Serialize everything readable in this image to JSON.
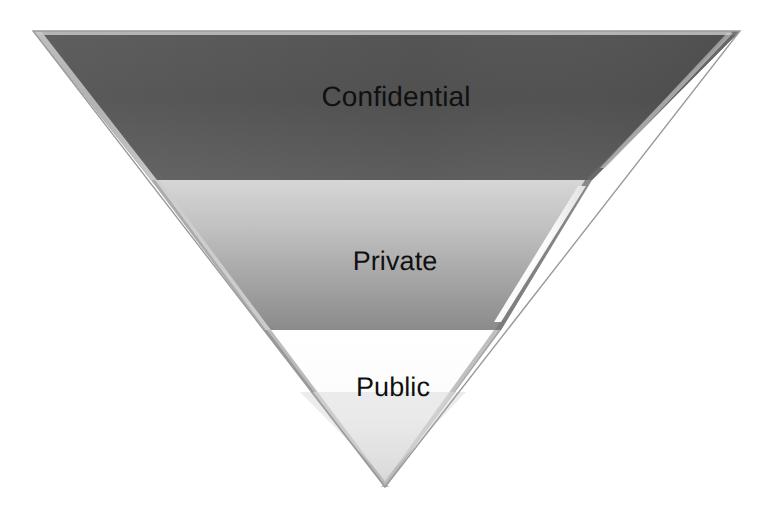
{
  "diagram": {
    "type": "inverted-pyramid",
    "background_color": "#ffffff",
    "outline_color": "#9a9a9a",
    "label_color": "#101010",
    "geometry": {
      "top_left_x": 33,
      "top_right_x": 740,
      "top_y": 31,
      "apex_x": 385,
      "apex_y": 487
    },
    "layers": [
      {
        "label": "Confidential",
        "level": 1,
        "fill_top_color": "#4f4f4f",
        "fill_bottom_color": "#5f5f5f",
        "top_y": 31,
        "bottom_y": 180,
        "label_x": 396,
        "label_y": 97,
        "font_size_px": 28
      },
      {
        "label": "Private",
        "level": 2,
        "fill_top_color": "#d0d0d0",
        "fill_bottom_color": "#8a8a8a",
        "top_y": 180,
        "bottom_y": 330,
        "label_x": 395,
        "label_y": 261,
        "font_size_px": 27
      },
      {
        "label": "Public",
        "level": 3,
        "fill_top_color": "#ffffff",
        "fill_bottom_color": "#d8d8d8",
        "top_y": 330,
        "bottom_y": 487,
        "label_x": 393,
        "label_y": 387,
        "font_size_px": 27
      }
    ],
    "bevels": {
      "left_edge_color": "#b8b8b8",
      "right_edge_highlight_color": "#ffffff",
      "right_edge_shadow_color": "#707070",
      "top_edge_color": "#bdbdbd"
    }
  }
}
